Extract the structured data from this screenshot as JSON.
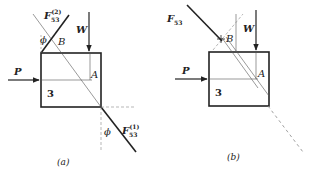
{
  "figure": {
    "panels": [
      {
        "id": "a",
        "caption": "(a)",
        "body_label": "3",
        "labels": {
          "P": "P",
          "W": "W",
          "A": "A",
          "B": "B",
          "phi_top": "ϕ",
          "phi_bottom": "ϕ",
          "F_top_main": "F",
          "F_top_sub": "53",
          "F_top_sup": "(2)",
          "F_bottom_main": "F",
          "F_bottom_sub": "53",
          "F_bottom_sup": "(1)"
        }
      },
      {
        "id": "b",
        "caption": "(b)",
        "body_label": "3",
        "labels": {
          "P": "P",
          "W": "W",
          "A": "A",
          "B": "B",
          "F_main": "F",
          "F_sub": "53"
        }
      }
    ],
    "colors": {
      "ink": "#222222",
      "thin": "#555555",
      "dashed": "#888888"
    }
  }
}
